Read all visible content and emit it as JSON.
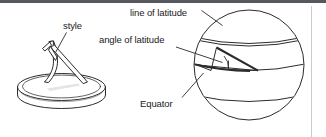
{
  "figure": {
    "background_color": "#ffffff",
    "line_color": "#2b2b2b",
    "top_rule_color": "#55585c",
    "divider_color": "#c9cbcd",
    "text_color": "#1b1b1b"
  },
  "labels": {
    "style": "style",
    "line_of_latitude": "line of latitude",
    "angle_of_latitude": "angle of latitude",
    "equator": "Equator"
  },
  "left_diagram": {
    "name": "sundial",
    "parts": {
      "base": "circular dial plate",
      "gnomon": "style"
    }
  },
  "right_diagram": {
    "name": "globe",
    "parts": {
      "sphere": "globe outline",
      "equator": "Equator",
      "latitude_line": "line of latitude",
      "angle_wedge": "angle of latitude",
      "southern_latitude_line": "southern line of latitude"
    }
  }
}
